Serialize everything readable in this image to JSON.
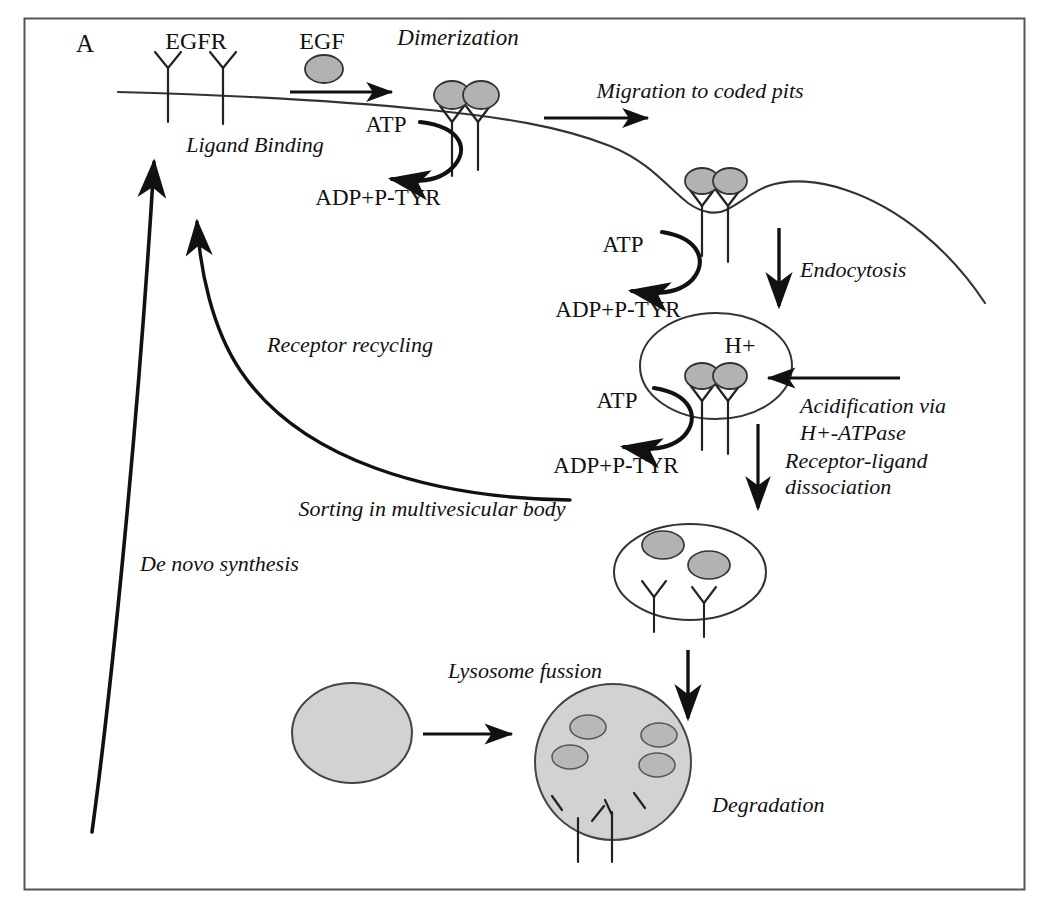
{
  "figure": {
    "panel_label": "A",
    "title_semantic": "EGFR endocytic trafficking pathway",
    "background_color": "#ffffff",
    "frame_color": "#555555",
    "ink_color": "#111111",
    "vesicle_fill": "#b2b2b2",
    "lysosome_fill": "#d2d2d2"
  },
  "labels": {
    "panel": "A",
    "egfr": "EGFR",
    "egf": "EGF",
    "dimerization": "Dimerization",
    "ligand_binding": "Ligand Binding",
    "atp_1": "ATP",
    "adp_1": "ADP+P-TYR",
    "migration": "Migration to coded pits",
    "atp_2": "ATP",
    "adp_2": "ADP+P-TYR",
    "endocytosis": "Endocytosis",
    "h_plus": "H+",
    "atp_3": "ATP",
    "adp_3": "ADP+P-TYR",
    "acidification_line1": "Acidification via",
    "acidification_line2": "H+-ATPase",
    "receptor_ligand_line1": "Receptor-ligand",
    "receptor_ligand_line2": "dissociation",
    "receptor_recycling": "Receptor recycling",
    "sorting": "Sorting in multivesicular body",
    "de_novo": "De novo synthesis",
    "lysosome_fusion": "Lysosome fussion",
    "degradation": "Degradation"
  },
  "pathway_steps": [
    {
      "id": "ligand-binding",
      "label": "Ligand Binding",
      "order": 1
    },
    {
      "id": "dimerization",
      "label": "Dimerization",
      "order": 2
    },
    {
      "id": "migration",
      "label": "Migration to coded pits",
      "order": 3
    },
    {
      "id": "endocytosis",
      "label": "Endocytosis",
      "order": 4
    },
    {
      "id": "acidification",
      "label": "Acidification via H+-ATPase",
      "order": 5
    },
    {
      "id": "receptor-ligand-dissociation",
      "label": "Receptor-ligand dissociation",
      "order": 6
    },
    {
      "id": "sorting",
      "label": "Sorting in multivesicular body",
      "order": 7
    },
    {
      "id": "receptor-recycling",
      "label": "Receptor recycling",
      "order": 8
    },
    {
      "id": "de-novo-synthesis",
      "label": "De novo synthesis",
      "order": 9
    },
    {
      "id": "lysosome-fusion",
      "label": "Lysosome fussion",
      "order": 10
    },
    {
      "id": "degradation",
      "label": "Degradation",
      "order": 11
    }
  ],
  "reactions": [
    {
      "id": "phosphorylation-membrane",
      "substrate": "ATP",
      "product": "ADP+P-TYR"
    },
    {
      "id": "phosphorylation-pit",
      "substrate": "ATP",
      "product": "ADP+P-TYR"
    },
    {
      "id": "phosphorylation-endosome",
      "substrate": "ATP",
      "product": "ADP+P-TYR"
    }
  ]
}
